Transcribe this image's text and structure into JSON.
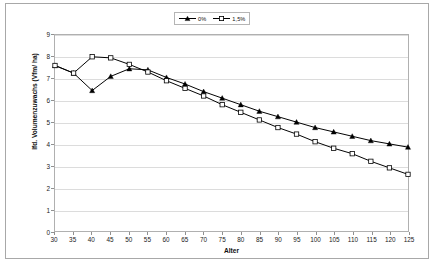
{
  "chart_data": {
    "type": "line",
    "title": "",
    "xlabel": "Alter",
    "ylabel": "lfd. Volumenzuwachs (Vfm/ ha)",
    "x": [
      30,
      35,
      40,
      45,
      50,
      55,
      60,
      65,
      70,
      75,
      80,
      85,
      90,
      95,
      100,
      105,
      110,
      115,
      120,
      125
    ],
    "xlim": [
      30,
      125
    ],
    "ylim": [
      0,
      9
    ],
    "x_tick_labels": [
      "30",
      "35",
      "40",
      "45",
      "50",
      "55",
      "60",
      "65",
      "70",
      "75",
      "80",
      "85",
      "90",
      "95",
      "100",
      "105",
      "110",
      "115",
      "120",
      "125"
    ],
    "y_tick_labels": [
      "0",
      "1",
      "2",
      "3",
      "4",
      "5",
      "6",
      "7",
      "8",
      "9"
    ],
    "y_ticks": [
      0,
      1,
      2,
      3,
      4,
      5,
      6,
      7,
      8,
      9
    ],
    "grid": "horizontal",
    "legend_position": "top-center",
    "series": [
      {
        "name": "0%",
        "marker": "filled-triangle",
        "color": "#000000",
        "values": [
          7.6,
          7.25,
          6.45,
          7.1,
          7.45,
          7.4,
          7.05,
          6.75,
          6.4,
          6.1,
          5.8,
          5.5,
          5.25,
          5.0,
          4.75,
          4.55,
          4.35,
          4.15,
          4.0,
          3.85
        ]
      },
      {
        "name": "1,5%",
        "marker": "open-square",
        "color": "#000000",
        "values": [
          7.6,
          7.25,
          8.0,
          7.95,
          7.65,
          7.3,
          6.9,
          6.55,
          6.2,
          5.8,
          5.45,
          5.1,
          4.75,
          4.45,
          4.1,
          3.8,
          3.55,
          3.2,
          2.9,
          2.6
        ]
      }
    ]
  },
  "legend": {
    "entries": [
      {
        "label": "0%"
      },
      {
        "label": "1,5%"
      }
    ]
  },
  "axes": {
    "x_title": "Alter",
    "y_title": "lfd. Volumenzuwachs (Vfm/ ha)"
  }
}
